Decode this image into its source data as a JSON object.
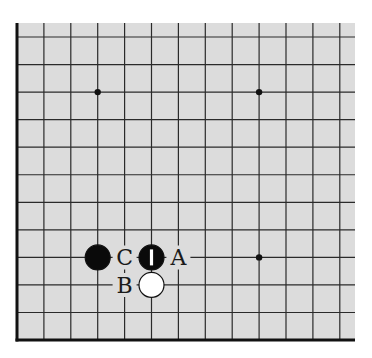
{
  "diagram": {
    "type": "go-board-fragment",
    "columns": 13,
    "rows": 12,
    "colors": {
      "background": "#ffffff",
      "board": "#dcdcdc",
      "line": "#2a2a2a",
      "edge": "#111111",
      "black_stone": "#0a0a0a",
      "white_stone": "#ffffff"
    },
    "edges": [
      "left",
      "bottom"
    ],
    "star_points": [
      {
        "col": 3,
        "row": 2
      },
      {
        "col": 9,
        "row": 2
      },
      {
        "col": 9,
        "row": 8
      }
    ],
    "stones": [
      {
        "color": "black",
        "col": 3,
        "row": 8,
        "marker": ""
      },
      {
        "color": "black",
        "col": 5,
        "row": 8,
        "marker": "1"
      },
      {
        "color": "white",
        "col": 5,
        "row": 9,
        "marker": ""
      }
    ],
    "labels": [
      {
        "text": "C",
        "col": 4,
        "row": 8
      },
      {
        "text": "A",
        "col": 6,
        "row": 8
      },
      {
        "text": "B",
        "col": 4,
        "row": 9
      }
    ]
  }
}
